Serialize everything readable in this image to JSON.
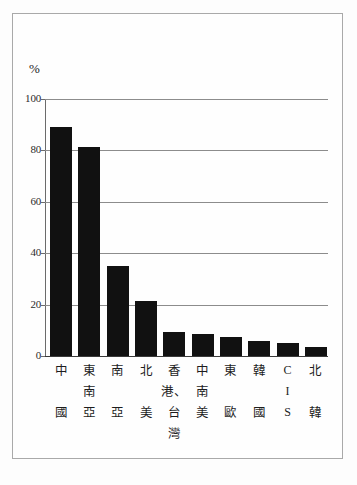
{
  "figure": {
    "unit_label": "%",
    "axis": {
      "y_ticks": [
        "0",
        "20",
        "40",
        "60",
        "80",
        "100"
      ],
      "y_min": 0,
      "y_max": 100
    }
  },
  "chart_data": {
    "type": "bar",
    "title": "",
    "subtitle": "",
    "xlabel": "",
    "ylabel": "%",
    "ylim": [
      0,
      100
    ],
    "yticks": [
      0,
      20,
      40,
      60,
      80,
      100
    ],
    "grid": true,
    "legend": "none",
    "orientation": "vertical",
    "bar_color": "#111111",
    "categories": [
      "中國",
      "東南亞",
      "南亞",
      "北美",
      "香港、台灣",
      "中南美",
      "東歐",
      "韓國",
      "CIS",
      "北韓"
    ],
    "category_chars": [
      [
        "中",
        "",
        "國"
      ],
      [
        "東",
        "南",
        "亞"
      ],
      [
        "南",
        "",
        "亞"
      ],
      [
        "北",
        "",
        "美"
      ],
      [
        "香",
        "港、台",
        "灣"
      ],
      [
        "中",
        "南",
        "美"
      ],
      [
        "東",
        "",
        "歐"
      ],
      [
        "韓",
        "",
        "國"
      ],
      [
        "C",
        "I",
        "S"
      ],
      [
        "北",
        "",
        "韓"
      ]
    ],
    "values": [
      89,
      81.5,
      35,
      21.5,
      9.5,
      8.5,
      7.5,
      6,
      5,
      3.5
    ]
  }
}
